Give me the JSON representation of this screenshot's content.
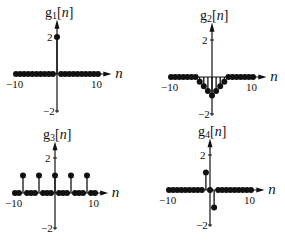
{
  "chart_data": [
    {
      "type": "stem",
      "title": "g1[n]",
      "title_base": "g",
      "title_sub": "1",
      "title_arg": "[n]",
      "xlabel": "n",
      "xlim": [
        -10,
        10
      ],
      "ylim": [
        -2,
        2
      ],
      "xticks": [
        "-10",
        "10"
      ],
      "yticks": [
        "2",
        "-2"
      ],
      "x": [
        -10,
        -9,
        -8,
        -7,
        -6,
        -5,
        -4,
        -3,
        -2,
        -1,
        0,
        1,
        2,
        3,
        4,
        5,
        6,
        7,
        8,
        9,
        10
      ],
      "values": [
        0,
        0,
        0,
        0,
        0,
        0,
        0,
        0,
        0,
        0,
        2,
        0,
        0,
        0,
        0,
        0,
        0,
        0,
        0,
        0,
        0
      ]
    },
    {
      "type": "stem",
      "title": "g2[n]",
      "title_base": "g",
      "title_sub": "2",
      "title_arg": "[n]",
      "xlabel": "n",
      "xlim": [
        -10,
        10
      ],
      "ylim": [
        -2,
        2
      ],
      "xticks": [
        "-10",
        "10"
      ],
      "yticks": [
        "2",
        "-2"
      ],
      "x": [
        -10,
        -9,
        -8,
        -7,
        -6,
        -5,
        -4,
        -3,
        -2,
        -1,
        0,
        1,
        2,
        3,
        4,
        5,
        6,
        7,
        8,
        9,
        10
      ],
      "values": [
        0,
        0,
        0,
        0,
        0,
        0,
        0,
        -0.25,
        -0.5,
        -0.75,
        -1,
        -0.75,
        -0.5,
        -0.25,
        0,
        0,
        0,
        0,
        0,
        0,
        0
      ]
    },
    {
      "type": "stem",
      "title": "g3[n]",
      "title_base": "g",
      "title_sub": "3",
      "title_arg": "[n]",
      "xlabel": "n",
      "xlim": [
        -10,
        10
      ],
      "ylim": [
        -2,
        2
      ],
      "xticks": [
        "-10",
        "10"
      ],
      "yticks": [
        "2",
        "-2"
      ],
      "x": [
        -10,
        -9,
        -8,
        -7,
        -6,
        -5,
        -4,
        -3,
        -2,
        -1,
        0,
        1,
        2,
        3,
        4,
        5,
        6,
        7,
        8,
        9,
        10
      ],
      "values": [
        0,
        0,
        1,
        0,
        0,
        0,
        1,
        0,
        0,
        0,
        1,
        0,
        0,
        0,
        1,
        0,
        0,
        0,
        1,
        0,
        0
      ]
    },
    {
      "type": "stem",
      "title": "g4[n]",
      "title_base": "g",
      "title_sub": "4",
      "title_arg": "[n]",
      "xlabel": "n",
      "xlim": [
        -10,
        10
      ],
      "ylim": [
        -2,
        2
      ],
      "xticks": [
        "-10",
        "10"
      ],
      "yticks": [
        "2",
        "-2"
      ],
      "x": [
        -10,
        -9,
        -8,
        -7,
        -6,
        -5,
        -4,
        -3,
        -2,
        -1,
        0,
        1,
        2,
        3,
        4,
        5,
        6,
        7,
        8,
        9,
        10
      ],
      "values": [
        0,
        0,
        0,
        0,
        0,
        0,
        0,
        0,
        0,
        1,
        0,
        -1,
        0,
        0,
        0,
        0,
        0,
        0,
        0,
        0,
        0
      ]
    }
  ],
  "layout": {
    "panels": [
      {
        "ox": 57,
        "oy": 74,
        "xscale": 4.1,
        "yscale": 18.5
      },
      {
        "ox": 212,
        "oy": 77,
        "xscale": 4.1,
        "yscale": 18.5
      },
      {
        "ox": 55,
        "oy": 193,
        "xscale": 4.0,
        "yscale": 17.5
      },
      {
        "ox": 210,
        "oy": 190,
        "xscale": 4.1,
        "yscale": 17.5
      }
    ],
    "color": "#111111"
  }
}
